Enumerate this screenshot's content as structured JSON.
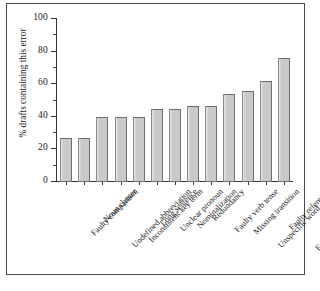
{
  "chart_data": {
    "type": "bar",
    "title": "",
    "xlabel": "",
    "ylabel": "% drafts containing this error",
    "ylim": [
      0,
      100
    ],
    "ytick_labels": [
      "0",
      "20",
      "40",
      "60",
      "80",
      "100"
    ],
    "ytick_values": [
      0,
      20,
      40,
      60,
      80,
      100
    ],
    "yminor_values": [
      10,
      30,
      50,
      70,
      90
    ],
    "grid": false,
    "legend": false,
    "bar_color": "#c9c9c9",
    "bar_edge_color": "#6e6e6e",
    "categories": [
      "Faulty comparison",
      "Noun cluster",
      "Undefined abbreviation",
      "Inconsistent key term",
      "Long sentence",
      "Unclear pronoun",
      "Nominalization",
      "Redundancy",
      "Faulty verb tense",
      "Missing transition",
      "Unspecific word choice",
      "Faulty reference",
      "Faulty structural element"
    ],
    "values": [
      27,
      27,
      40,
      40,
      40,
      45,
      45,
      46.5,
      46.5,
      54,
      56,
      62,
      76
    ]
  },
  "figure": {
    "border_color": "#4a4a4a",
    "background": "#ffffff"
  }
}
